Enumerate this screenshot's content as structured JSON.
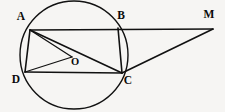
{
  "figure": {
    "background_color": "#f6f5f3",
    "stroke_color": "#111111",
    "width": 225,
    "height": 112,
    "circle": {
      "name": "circumscribed-circle",
      "center_label": "O",
      "cx": 74,
      "cy": 55,
      "r": 54
    },
    "points": [
      {
        "id": "A",
        "label": "A",
        "x": 30,
        "y": 30,
        "label_x": 21,
        "label_y": 17,
        "on_circle": true
      },
      {
        "id": "B",
        "label": "B",
        "x": 118,
        "y": 28,
        "label_x": 121,
        "label_y": 16,
        "on_circle": true
      },
      {
        "id": "C",
        "label": "C",
        "x": 122,
        "y": 73,
        "label_x": 128,
        "label_y": 81,
        "on_circle": true
      },
      {
        "id": "D",
        "label": "D",
        "x": 25,
        "y": 72,
        "label_x": 16,
        "label_y": 80,
        "on_circle": true
      },
      {
        "id": "O",
        "label": "O",
        "x": 72,
        "y": 57,
        "label_x": 75,
        "label_y": 63,
        "on_circle": false
      },
      {
        "id": "M",
        "label": "M",
        "x": 213,
        "y": 29,
        "label_x": 209,
        "label_y": 15,
        "on_circle": false
      }
    ],
    "segments": [
      {
        "id": "AM",
        "from": "A",
        "to": "M",
        "note": "chord AB extended to M"
      },
      {
        "id": "AD",
        "from": "A",
        "to": "D"
      },
      {
        "id": "AO",
        "from": "A",
        "to": "O"
      },
      {
        "id": "AC",
        "from": "A",
        "to": "C"
      },
      {
        "id": "OD",
        "from": "O",
        "to": "D"
      },
      {
        "id": "DC",
        "from": "D",
        "to": "C"
      },
      {
        "id": "BC",
        "from": "B",
        "to": "C"
      },
      {
        "id": "CM",
        "from": "C",
        "to": "M"
      }
    ]
  }
}
